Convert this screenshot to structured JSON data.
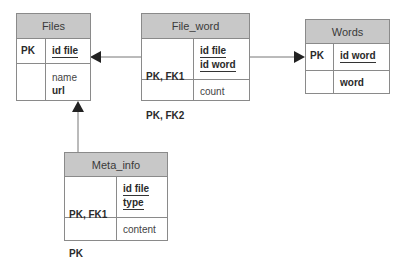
{
  "diagram": {
    "type": "entity-relationship",
    "entities": [
      {
        "name": "Files",
        "key_labels": [
          "PK"
        ],
        "key_attributes": [
          "id file"
        ],
        "attributes": [
          {
            "name": "name",
            "bold": false
          },
          {
            "name": "url",
            "bold": true
          }
        ]
      },
      {
        "name": "File_word",
        "key_labels": [
          "PK, FK1",
          "PK, FK2"
        ],
        "key_attributes": [
          "id file",
          "id word"
        ],
        "attributes": [
          {
            "name": "count",
            "bold": false
          }
        ]
      },
      {
        "name": "Words",
        "key_labels": [
          "PK"
        ],
        "key_attributes": [
          "id word"
        ],
        "attributes": [
          {
            "name": "word",
            "bold": true
          }
        ]
      },
      {
        "name": "Meta_info",
        "key_labels": [
          "PK, FK1",
          "PK"
        ],
        "key_attributes": [
          "id file",
          "type"
        ],
        "attributes": [
          {
            "name": "content",
            "bold": false
          }
        ]
      }
    ],
    "relationships": [
      {
        "from": "File_word",
        "to": "Files"
      },
      {
        "from": "File_word",
        "to": "Words"
      },
      {
        "from": "Meta_info",
        "to": "Files"
      }
    ],
    "colors": {
      "header_fill": "#c8c8c8",
      "border": "#8a8a8a",
      "line": "#777777",
      "arrow": "#222222"
    }
  }
}
